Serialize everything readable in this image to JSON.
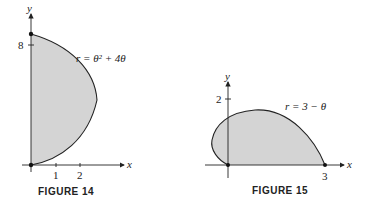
{
  "figures": [
    {
      "caption": "FIGURE 14",
      "equation": "r = θ² + 4θ",
      "x_axis_label": "x",
      "y_axis_label": "y",
      "x_ticks": [
        "1",
        "2"
      ],
      "y_ticks": [
        "8"
      ],
      "fill_color": "#d4d4d4",
      "stroke_color": "#222222"
    },
    {
      "caption": "FIGURE 15",
      "equation": "r = 3 − θ",
      "x_axis_label": "x",
      "y_axis_label": "y",
      "x_ticks": [
        "3"
      ],
      "y_ticks": [
        "2"
      ],
      "fill_color": "#d4d4d4",
      "stroke_color": "#222222"
    }
  ]
}
